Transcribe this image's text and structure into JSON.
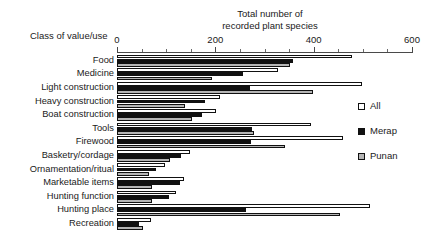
{
  "chart_data": {
    "type": "bar",
    "orientation": "horizontal",
    "title": "",
    "xlabel": "Total number of recorded plant species",
    "xlabel_line1": "Total number of",
    "xlabel_line2": "recorded plant species",
    "ylabel": "Class of value/use",
    "xlim": [
      0,
      600
    ],
    "xticks": [
      0,
      200,
      400,
      600
    ],
    "xtick_labels": [
      "0",
      "200",
      "400",
      "600"
    ],
    "minor_tick_step": 50,
    "grid": false,
    "legend_position": "right",
    "categories": [
      "Food",
      "Medicine",
      "Light construction",
      "Heavy construction",
      "Boat construction",
      "Tools",
      "Firewood",
      "Basketry/cordage",
      "Ornamentation/ritual",
      "Marketable items",
      "Hunting function",
      "Hunting place",
      "Recreation"
    ],
    "series": [
      {
        "name": "All",
        "color": "#ffffff",
        "values": [
          478,
          327,
          498,
          210,
          201,
          395,
          460,
          149,
          98,
          136,
          120,
          515,
          69
        ]
      },
      {
        "name": "Merap",
        "color": "#111111",
        "values": [
          358,
          256,
          270,
          179,
          173,
          275,
          273,
          130,
          79,
          128,
          106,
          262,
          45
        ]
      },
      {
        "name": "Punan",
        "color": "#b5b5b5",
        "values": [
          352,
          193,
          399,
          138,
          152,
          279,
          342,
          108,
          65,
          71,
          71,
          453,
          53
        ]
      }
    ],
    "legend": [
      {
        "label": "All",
        "swatch": "white-square"
      },
      {
        "label": "Merap",
        "swatch": "black-square"
      },
      {
        "label": "Punan",
        "swatch": "gray-square"
      }
    ]
  }
}
